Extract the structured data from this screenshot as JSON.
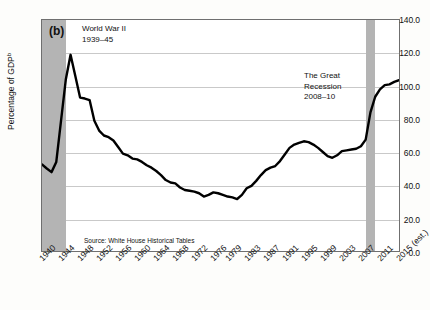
{
  "figure": {
    "panel_label": "(b)",
    "source_note": "Source: White House Historical Tables"
  },
  "annotations": {
    "wwii": {
      "line1": "World War II",
      "line2": "1939–45"
    },
    "recession": {
      "line1": "The Great",
      "line2": "Recession",
      "line3": "2008–10"
    }
  },
  "axes": {
    "y_title": "Percentage of GDP",
    "y_title_sup": "b",
    "y_ticks": [
      "0.0",
      "20.0",
      "40.0",
      "60.0",
      "80.0",
      "100.0",
      "120.0",
      "140.0"
    ],
    "x_ticks": [
      "1940",
      "1944",
      "1948",
      "1952",
      "1956",
      "1960",
      "1964",
      "1968",
      "1972",
      "1976",
      "1979",
      "1983",
      "1987",
      "1991",
      "1995",
      "1999",
      "2003",
      "2007",
      "2011",
      "2015 (est.)"
    ]
  },
  "colors": {
    "line": "#000000",
    "band": "#b4b4b4",
    "grid": "#c9c9c9",
    "frame": "#6f6f6f",
    "background": "#ffffff"
  },
  "chart_data": {
    "type": "line",
    "xlabel": "",
    "ylabel": "Percentage of GDP",
    "xlim": [
      1940,
      2015
    ],
    "ylim": [
      0,
      140
    ],
    "ytick_step": 20,
    "grid": true,
    "legend": "none",
    "source": "Source: White House Historical Tables",
    "shaded_bands": [
      {
        "label": "World War II",
        "start": 1939,
        "end": 1945,
        "note": "1939–45"
      },
      {
        "label": "The Great Recession",
        "start": 2008,
        "end": 2010,
        "note": "2008–10"
      }
    ],
    "x": [
      1940,
      1941,
      1942,
      1943,
      1944,
      1945,
      1946,
      1947,
      1948,
      1949,
      1950,
      1951,
      1952,
      1953,
      1954,
      1955,
      1956,
      1957,
      1958,
      1959,
      1960,
      1961,
      1962,
      1963,
      1964,
      1965,
      1966,
      1967,
      1968,
      1969,
      1970,
      1971,
      1972,
      1973,
      1974,
      1975,
      1976,
      1977,
      1978,
      1979,
      1980,
      1981,
      1982,
      1983,
      1984,
      1985,
      1986,
      1987,
      1988,
      1989,
      1990,
      1991,
      1992,
      1993,
      1994,
      1995,
      1996,
      1997,
      1998,
      1999,
      2000,
      2001,
      2002,
      2003,
      2004,
      2005,
      2006,
      2007,
      2008,
      2009,
      2010,
      2011,
      2012,
      2013,
      2014,
      2015
    ],
    "y": [
      52.4,
      50.0,
      47.8,
      54.0,
      79.0,
      103.9,
      118.9,
      106.0,
      93.0,
      92.4,
      91.5,
      79.0,
      73.0,
      70.0,
      69.0,
      67.0,
      63.0,
      59.0,
      58.0,
      56.0,
      55.5,
      54.0,
      52.0,
      50.5,
      48.5,
      46.0,
      43.0,
      41.5,
      41.0,
      38.5,
      37.0,
      36.5,
      36.0,
      35.0,
      33.0,
      34.0,
      35.5,
      35.0,
      34.0,
      33.0,
      32.5,
      31.5,
      34.0,
      38.0,
      39.5,
      42.5,
      46.0,
      49.0,
      50.5,
      51.5,
      54.5,
      58.5,
      62.5,
      64.5,
      65.5,
      66.5,
      66.0,
      64.5,
      62.5,
      60.0,
      57.5,
      56.5,
      58.0,
      60.5,
      61.0,
      61.5,
      62.0,
      63.5,
      67.5,
      84.0,
      93.5,
      98.0,
      100.5,
      101.0,
      102.5,
      103.5
    ]
  }
}
